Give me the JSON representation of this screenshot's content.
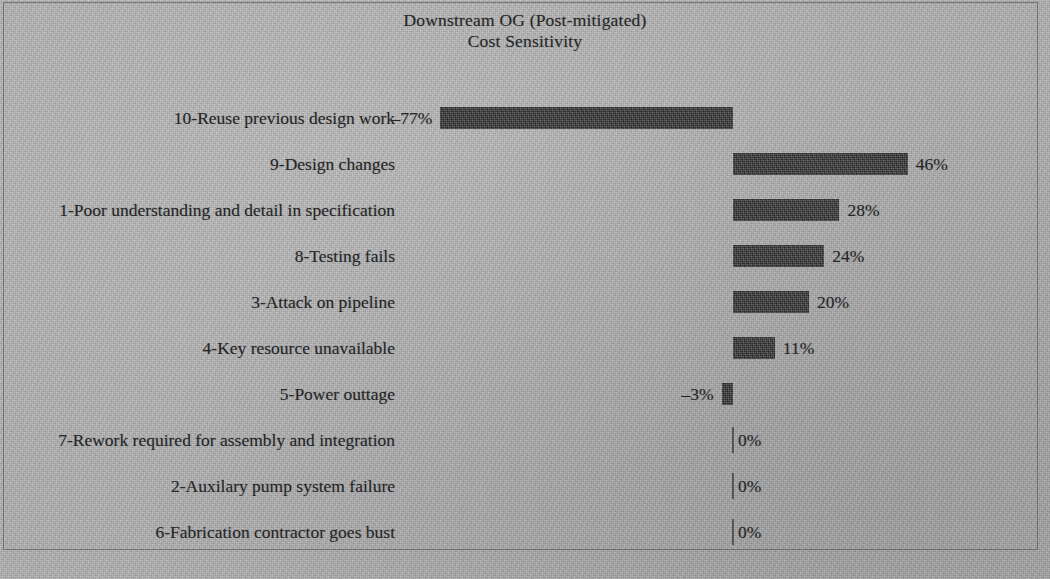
{
  "chart_data": {
    "type": "bar",
    "orientation": "horizontal",
    "title": "Downstream OG (Post-mitigated) Cost Sensitivity",
    "title_lines": [
      "Downstream OG (Post-mitigated)",
      "Cost Sensitivity"
    ],
    "xlabel": "",
    "ylabel": "",
    "grid": false,
    "legend": "none",
    "units": "percent",
    "axis_zero": 0,
    "xlim": [
      -80,
      50
    ],
    "bar_color": "#3b3b3c",
    "background_color": "#b4b4b4",
    "text_color": "#262628",
    "categories": [
      "10-Reuse previous design work",
      "9-Design changes",
      "1-Poor understanding and detail in specification",
      "8-Testing fails",
      "3-Attack on pipeline",
      "4-Key resource unavailable",
      "5-Power outtage",
      "7-Rework required for assembly and integration",
      "2-Auxilary pump system failure",
      "6-Fabrication contractor goes bust"
    ],
    "values": [
      -77,
      46,
      28,
      24,
      20,
      11,
      -3,
      0,
      0,
      0
    ],
    "value_labels": [
      "–77%",
      "46%",
      "28%",
      "24%",
      "20%",
      "11%",
      "–3%",
      "0%",
      "0%",
      "0%"
    ]
  }
}
